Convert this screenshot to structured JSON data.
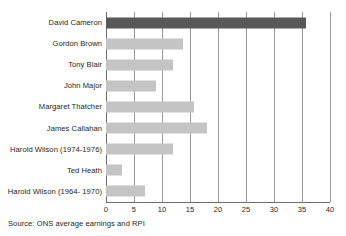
{
  "chart_data": {
    "type": "bar",
    "orientation": "horizontal",
    "title": "",
    "xlabel": "",
    "ylabel": "",
    "xlim": [
      0,
      40
    ],
    "xticks": [
      "0",
      "5",
      "10",
      "15",
      "20",
      "25",
      "30",
      "35",
      "40"
    ],
    "xtick_values": [
      0,
      5,
      10,
      15,
      20,
      25,
      30,
      35,
      40
    ],
    "grid": "vertical",
    "legend": "none",
    "categories": [
      "David Cameron",
      "Gordon Brown",
      "Tony Blair",
      "John Major",
      "Margaret Thatcher",
      "James Callahan",
      "Harold Wilson (1974-1976)",
      "Ted Heath",
      "Harold Wilson (1964- 1970)"
    ],
    "values": [
      35.8,
      13.8,
      12.0,
      9.0,
      15.8,
      18.0,
      11.9,
      2.9,
      7.0
    ],
    "bar_colors": [
      "#585858",
      "#c4c4c4",
      "#c4c4c4",
      "#c4c4c4",
      "#c4c4c4",
      "#c4c4c4",
      "#c4c4c4",
      "#c4c4c4",
      "#c4c4c4"
    ],
    "annotations": [
      "Source: ONS average earnings and RPI"
    ]
  },
  "footer": {
    "source": "Source: ONS average earnings and RPI"
  },
  "colors": {
    "highlight_bar": "#585858",
    "default_bar": "#c4c4c4",
    "gridline": "#9a9a9a",
    "axis": "#6d6d6d",
    "text": "#231f20",
    "background": "#ffffff"
  }
}
